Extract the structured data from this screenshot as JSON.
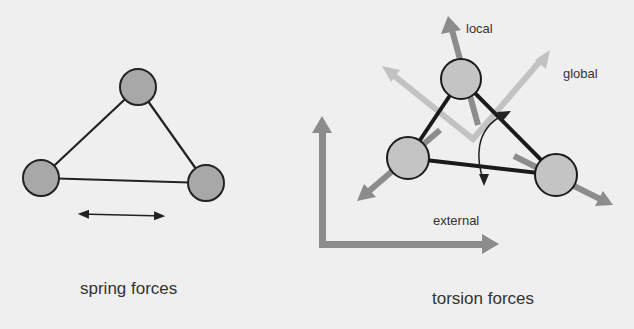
{
  "left_panel": {
    "caption": "spring forces",
    "nodes": [
      {
        "id": "top",
        "cx": 138,
        "cy": 87,
        "r": 18
      },
      {
        "id": "left",
        "cx": 41,
        "cy": 178,
        "r": 18
      },
      {
        "id": "right",
        "cx": 206,
        "cy": 183,
        "r": 18
      }
    ],
    "double_arrow": {
      "x1": 78,
      "y1": 214,
      "x2": 165,
      "y2": 216
    }
  },
  "right_panel": {
    "caption": "torsion forces",
    "labels": {
      "local": "local",
      "global": "global",
      "external": "external"
    },
    "nodes": [
      {
        "id": "top",
        "cx": 461,
        "cy": 79,
        "r": 20
      },
      {
        "id": "left",
        "cx": 408,
        "cy": 158,
        "r": 21
      },
      {
        "id": "right",
        "cx": 556,
        "cy": 175,
        "r": 21
      }
    ]
  },
  "colors": {
    "background": "#efefef",
    "node_fill_left": "#a8a8a8",
    "node_fill_right": "#c4c4c4",
    "edge": "#222222",
    "arrow_dark": "#8c8c8c",
    "arrow_light": "#c2c2c2",
    "text": "#333333"
  }
}
